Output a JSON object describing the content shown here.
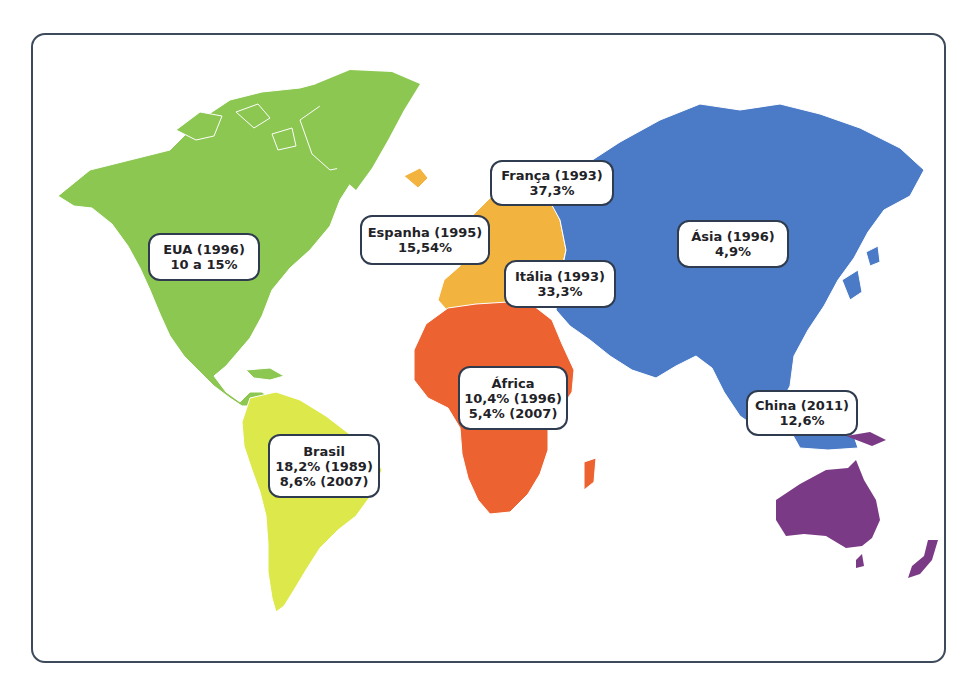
{
  "colors": {
    "americas_north": "#8cc751",
    "americas_south": "#dde94a",
    "europe": "#f2b43f",
    "africa": "#ec6331",
    "asia": "#4b7bc6",
    "oceania": "#7a3a86",
    "frame": "#3d4a5c",
    "label_border": "#2f3b4e"
  },
  "labels": {
    "eua": {
      "line1": "EUA (1996)",
      "line2": "10 a 15%"
    },
    "franca": {
      "line1": "França (1993)",
      "line2": "37,3%"
    },
    "espanha": {
      "line1": "Espanha (1995)",
      "line2": "15,54%"
    },
    "italia": {
      "line1": "Itália (1993)",
      "line2": "33,3%"
    },
    "asia": {
      "line1": "Ásia (1996)",
      "line2": "4,9%"
    },
    "africa": {
      "line1": "África",
      "line2": "10,4% (1996)",
      "line3": "5,4% (2007)"
    },
    "brasil": {
      "line1": "Brasil",
      "line2": "18,2% (1989)",
      "line3": "8,6% (2007)"
    },
    "china": {
      "line1": "China  (2011)",
      "line2": "12,6%"
    }
  }
}
